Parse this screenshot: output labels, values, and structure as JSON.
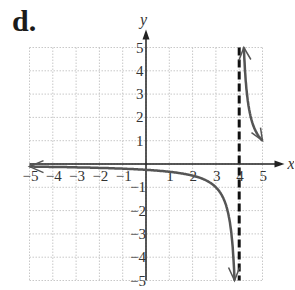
{
  "panel": {
    "label": "d."
  },
  "colors": {
    "grid": "#c8c8c8",
    "axis": "#222222",
    "curve": "#555555",
    "asymptote": "#111111"
  },
  "chart_data": {
    "type": "line",
    "title": "",
    "xlabel": "x",
    "ylabel": "y",
    "xlim": [
      -5,
      5
    ],
    "ylim": [
      -5,
      5
    ],
    "grid": true,
    "x_ticks": [
      -5,
      -4,
      -3,
      -2,
      -1,
      1,
      2,
      3,
      4,
      5
    ],
    "y_ticks": [
      -5,
      -4,
      -3,
      -2,
      -1,
      1,
      2,
      3,
      4,
      5
    ],
    "x_tick_labels": [
      "−5",
      "−4",
      "−3",
      "−2",
      "−1",
      "1",
      "2",
      "3",
      "4",
      "5"
    ],
    "y_tick_labels": [
      "−5",
      "−4",
      "−3",
      "−2",
      "−1",
      "1",
      "2",
      "3",
      "4",
      "5"
    ],
    "asymptotes": [
      {
        "type": "vertical",
        "x": 4,
        "style": "dashed"
      }
    ],
    "series": [
      {
        "name": "left branch",
        "function": "y = 1/(x - 4)",
        "x": [
          -5,
          -4,
          -3,
          -2,
          -1,
          0,
          1,
          2,
          3,
          3.5,
          3.8
        ],
        "y": [
          -0.11,
          -0.125,
          -0.14,
          -0.17,
          -0.2,
          -0.25,
          -0.33,
          -0.5,
          -1,
          -2,
          -5
        ]
      },
      {
        "name": "right branch",
        "function": "y = 1/(x - 4)",
        "x": [
          4.2,
          4.25,
          4.5,
          5
        ],
        "y": [
          5,
          4,
          2,
          1
        ]
      }
    ]
  }
}
